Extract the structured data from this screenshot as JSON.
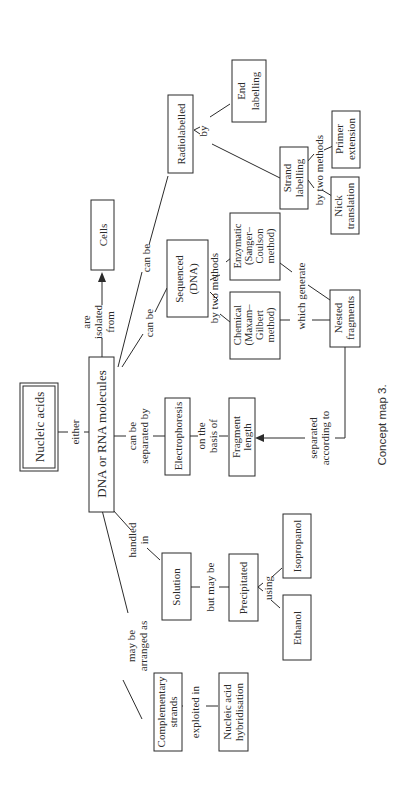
{
  "caption": "Concept map 3.",
  "colors": {
    "stroke": "#2b2b2b",
    "background": "#ffffff"
  },
  "nodes": {
    "nucleic_acids": "Nucleic acids",
    "dna_rna": "DNA or RNA molecules",
    "cells": "Cells",
    "radiolabelled": "Radiolabelled",
    "end_labelling": [
      "End",
      "labelling"
    ],
    "strand_labelling": [
      "Strand",
      "labelling"
    ],
    "primer_extension": [
      "Primer",
      "extension"
    ],
    "nick_translation": [
      "Nick",
      "translation"
    ],
    "sequenced": [
      "Sequenced",
      "(DNA)"
    ],
    "enzymatic": [
      "Enzymatic",
      "(Sanger–",
      "Coulson",
      "method)"
    ],
    "chemical": [
      "Chemical",
      "(Maxam–",
      "Gilbert",
      "method)"
    ],
    "nested_fragments": [
      "Nested",
      "fragments"
    ],
    "electrophoresis": "Electrophoresis",
    "fragment_length": [
      "Fragment",
      "length"
    ],
    "solution": "Solution",
    "precipitated": "Precipitated",
    "isopropanol": "Isopropanol",
    "ethanol": "Ethanol",
    "complementary_strands": [
      "Complementary",
      "strands"
    ],
    "nucleic_acid_hybridisation": [
      "Nucleic acid",
      "hybridisation"
    ]
  },
  "links": {
    "either": "either",
    "are_isolated_from": [
      "are",
      "isolated",
      "from"
    ],
    "can_be_radio": "can be",
    "can_be_seq": "can be",
    "by_radio": "by",
    "by_two_methods_strand": "by two methods",
    "by_two_methods_seq": "by two methods",
    "which_generate": "which generate",
    "separated_according_to": [
      "separated",
      "according to"
    ],
    "can_be_separated_by": [
      "can be",
      "separated by"
    ],
    "on_the_basis_of": [
      "on the",
      "basis of"
    ],
    "handled_in": [
      "handled",
      "in"
    ],
    "but_may_be": "but may be",
    "using": "using",
    "may_be_arranged_as": [
      "may be",
      "arranged as"
    ],
    "exploited_in": "exploited in"
  }
}
